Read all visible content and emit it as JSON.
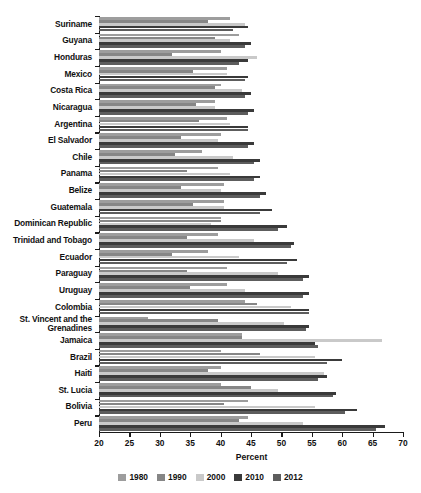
{
  "chart_data": {
    "type": "bar",
    "orientation": "horizontal",
    "title": "",
    "xlabel": "Percent",
    "ylabel": "",
    "xlim": [
      20,
      70
    ],
    "xticks": [
      20,
      25,
      30,
      35,
      40,
      45,
      50,
      55,
      60,
      65,
      70
    ],
    "grid": false,
    "legend_position": "bottom",
    "categories": [
      "Suriname",
      "Guyana",
      "Honduras",
      "Mexico",
      "Costa Rica",
      "Nicaragua",
      "Argentina",
      "El Salvador",
      "Chile",
      "Panama",
      "Belize",
      "Guatemala",
      "Dominican Republic",
      "Trinidad and Tobago",
      "Ecuador",
      "Paraguay",
      "Uruguay",
      "Colombia",
      "St. Vincent and the\nGrenadines",
      "Jamaica",
      "Brazil",
      "Haiti",
      "St. Lucia",
      "Bolivia",
      "Peru"
    ],
    "series": [
      {
        "name": "1980",
        "color": "#9d9d9d",
        "values": [
          41.5,
          43.0,
          40.0,
          41.0,
          40.0,
          39.0,
          41.0,
          40.0,
          37.0,
          39.5,
          40.5,
          40.5,
          40.0,
          39.5,
          38.0,
          41.0,
          41.0,
          44.0,
          28.0,
          43.5,
          40.0,
          40.0,
          40.0,
          44.5,
          44.5
        ]
      },
      {
        "name": "1990",
        "color": "#868686",
        "values": [
          38.0,
          39.0,
          32.0,
          35.5,
          39.0,
          36.0,
          36.5,
          33.5,
          32.5,
          34.5,
          33.5,
          35.5,
          40.0,
          34.5,
          32.0,
          34.5,
          35.0,
          46.0,
          39.5,
          43.5,
          46.5,
          38.0,
          45.0,
          40.5,
          43.0
        ]
      },
      {
        "name": "2000",
        "color": "#c9c9c9",
        "values": [
          44.0,
          41.5,
          46.0,
          41.0,
          43.5,
          39.0,
          41.5,
          39.5,
          42.0,
          41.5,
          40.0,
          40.5,
          38.5,
          45.5,
          43.0,
          49.5,
          44.0,
          51.5,
          50.5,
          66.5,
          55.5,
          57.0,
          49.5,
          55.5,
          53.5
        ]
      },
      {
        "name": "2010",
        "color": "#3a3a3a",
        "values": [
          44.5,
          45.0,
          44.5,
          44.5,
          45.0,
          45.5,
          44.5,
          45.5,
          46.5,
          46.5,
          47.5,
          48.5,
          51.0,
          52.0,
          52.5,
          54.5,
          54.5,
          54.5,
          54.5,
          55.5,
          60.0,
          57.5,
          59.0,
          62.5,
          67.0
        ]
      },
      {
        "name": "2012",
        "color": "#5d5d5d",
        "values": [
          42.0,
          44.0,
          43.0,
          44.0,
          44.0,
          44.5,
          44.5,
          44.5,
          45.5,
          45.5,
          46.5,
          46.5,
          49.5,
          51.5,
          51.0,
          53.5,
          53.5,
          54.5,
          54.0,
          56.0,
          57.5,
          56.0,
          58.5,
          60.5,
          65.5
        ]
      }
    ]
  },
  "axis": {
    "xtitle": "Percent"
  },
  "legend": {
    "items": [
      {
        "label": "1980",
        "color": "#9d9d9d"
      },
      {
        "label": "1990",
        "color": "#868686"
      },
      {
        "label": "2000",
        "color": "#c9c9c9"
      },
      {
        "label": "2010",
        "color": "#3a3a3a"
      },
      {
        "label": "2012",
        "color": "#5d5d5d"
      }
    ]
  }
}
